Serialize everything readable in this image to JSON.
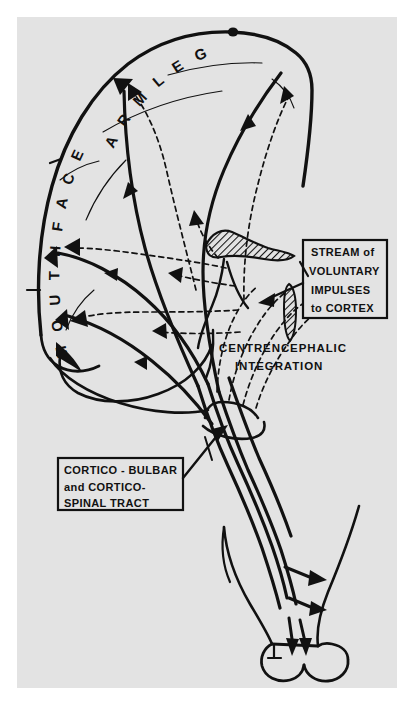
{
  "figure": {
    "background_color": "#ffffff",
    "plate_color": "#e3e3e3",
    "ink_color": "#111111"
  },
  "cortex_labels": {
    "left_band": "MOUTH FACE",
    "left_letters": [
      "M",
      "O",
      "U",
      "T",
      "H",
      "F",
      "A",
      "C",
      "E"
    ],
    "top_band": "ARM LEG",
    "top_letters": [
      "A",
      "R",
      "M",
      "L",
      "E",
      "G"
    ],
    "segments": [
      {
        "name": "mouth",
        "text": "MOUTH"
      },
      {
        "name": "face",
        "text": "FACE"
      },
      {
        "name": "arm",
        "text": "ARM"
      },
      {
        "name": "leg",
        "text": "LEG"
      }
    ]
  },
  "callout_boxes": [
    {
      "id": "stream-box",
      "name": "stream-of-voluntary-impulses-box",
      "lines": [
        "STREAM of",
        "VOLUNTARY",
        "IMPULSES",
        "to CORTEX"
      ],
      "x": 303,
      "y": 240,
      "width": 84,
      "height": 78
    },
    {
      "id": "tract-box",
      "name": "cortico-bulbar-spinal-tract-box",
      "lines": [
        "CORTICO - BULBAR",
        "and  CORTICO-",
        "SPINAL  TRACT"
      ],
      "x": 58,
      "y": 458,
      "width": 125,
      "height": 52
    }
  ],
  "captions": [
    {
      "id": "centrencephalic-caption",
      "name": "centrencephalic-integration-caption",
      "lines": [
        "CENTRENCEPHALIC",
        "INTEGRATION"
      ],
      "x": 219,
      "y": 352
    }
  ],
  "anatomy": {
    "structures": [
      {
        "name": "cerebral-cortex-outline"
      },
      {
        "name": "temporal-lobe-outline"
      },
      {
        "name": "vertex-marker-dot"
      },
      {
        "name": "hatched-thalamic-mass"
      },
      {
        "name": "hatched-brainstem-band"
      },
      {
        "name": "brainstem-outline"
      },
      {
        "name": "spinal-cord-outline"
      },
      {
        "name": "spinal-cord-terminal-lobes"
      },
      {
        "name": "tract-constriction-band"
      }
    ],
    "pathways": [
      {
        "name": "corticofugal-tract-solid",
        "style": "solid",
        "direction": "cortex-to-cord"
      },
      {
        "name": "ascending-impulse-stream-dashed",
        "style": "dashed",
        "direction": "centrencephalon-to-cortex"
      }
    ]
  }
}
